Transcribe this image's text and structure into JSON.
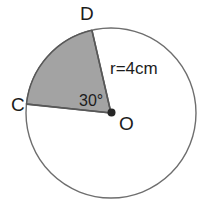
{
  "figure": {
    "type": "circle-sector-geometry-diagram",
    "background_color": "#ffffff",
    "stroke_color": "#6e6e6e",
    "sector_fill_color": "#a3a3a3",
    "sector_stroke_color": "#585858",
    "text_color": "#1c1c1c",
    "labels": {
      "point_d": "D",
      "point_c": "C",
      "point_o": "O",
      "radius": "r=4cm",
      "angle": "30°"
    },
    "geometry": {
      "center_x": 111,
      "center_y": 113,
      "radius_px": 85,
      "sector_start_angle_deg": 103,
      "sector_end_angle_deg": 174,
      "center_dot_radius_px": 4
    }
  }
}
